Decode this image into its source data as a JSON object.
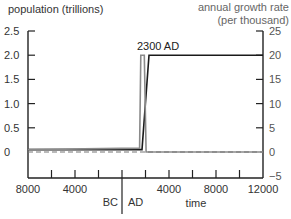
{
  "chart_data": {
    "type": "line",
    "title": "",
    "xlabel": "time",
    "era_labels": [
      "BC",
      "AD"
    ],
    "annotation": "2300 AD",
    "left_axis": {
      "label": "population (trillions)",
      "ylim": [
        0,
        2.5
      ],
      "ticks": [
        0,
        0.5,
        1.0,
        1.5,
        2.0,
        2.5
      ],
      "tick_labels": [
        "0",
        "0.5",
        "1.0",
        "1.5",
        "2.0",
        "2.5"
      ]
    },
    "right_axis": {
      "label_line1": "annual growth rate",
      "label_line2": "(per thousand)",
      "ylim": [
        -5,
        25
      ],
      "ticks": [
        -5,
        0,
        5,
        10,
        15,
        20,
        25
      ],
      "tick_labels": [
        "−5",
        "0",
        "5",
        "10",
        "15",
        "20",
        "25"
      ]
    },
    "x_axis": {
      "range": [
        -8000,
        12000
      ],
      "ticks": [
        -8000,
        -6000,
        -4000,
        -2000,
        0,
        2000,
        4000,
        6000,
        8000,
        10000,
        12000
      ],
      "labeled_ticks": [
        {
          "x": -8000,
          "label": "8000"
        },
        {
          "x": -4000,
          "label": "4000"
        },
        {
          "x": 4000,
          "label": "4000"
        },
        {
          "x": 8000,
          "label": "8000"
        },
        {
          "x": 12000,
          "label": "12000"
        }
      ]
    },
    "series": [
      {
        "name": "population (trillions)",
        "axis": "left",
        "color": "#1a1a1a",
        "x": [
          -8000,
          1700,
          2300,
          12000
        ],
        "values": [
          0.05,
          0.05,
          2.0,
          2.0
        ]
      },
      {
        "name": "annual growth rate (per thousand)",
        "axis": "right",
        "color": "#8a8a8a",
        "x": [
          -8000,
          1500,
          1600,
          1900,
          2050,
          12000
        ],
        "values": [
          0.5,
          0.8,
          20,
          20,
          0,
          0
        ]
      },
      {
        "name": "zero growth reference",
        "axis": "right",
        "style": "dashed",
        "color": "#777777",
        "x": [
          -8000,
          12000
        ],
        "values": [
          0,
          0
        ]
      }
    ]
  }
}
